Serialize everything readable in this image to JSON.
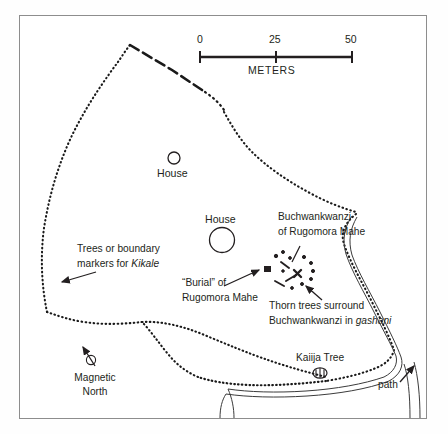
{
  "map": {
    "title": "Archaeological site plan of Rugomora Mahe",
    "frame": {
      "border_color": "#8d8d8d"
    },
    "scale_bar": {
      "ticks": [
        "0",
        "25",
        "50"
      ],
      "unit_label": "METERS",
      "max_meters": 50
    },
    "compass": {
      "label_line1": "Magnetic",
      "label_line2": "North"
    },
    "labels": {
      "house_upper": "House",
      "house_lower": "House",
      "buchwankwanzi_line1": "Buchwankwanzi",
      "buchwankwanzi_line2": "of Rugomora Mahe",
      "trees_line1": "Trees or boundary",
      "trees_line2_pre": "markers for ",
      "trees_line2_em": "Kikale",
      "burial_line1": "“Burial” of",
      "burial_line2": "Rugomora Mahe",
      "thorn_line1": "Thorn trees surround",
      "thorn_line2_pre": "Buchwankwanzi in ",
      "thorn_line2_em": "gashani",
      "kaiija_tree": "Kaiija Tree",
      "path": "path"
    },
    "symbols": {
      "house_circle_small": "house-circle-symbol",
      "house_circle_large": "house-circle-symbol",
      "tree_symbol": "kaiija-tree-symbol",
      "burial_marker": "burial-marker-symbol",
      "thorn_cluster": "thorn-tree-cluster-symbol",
      "compass_needle": "magnetic-north-arrow"
    },
    "colors": {
      "ink": "#231f20",
      "border": "#8d8d8d",
      "boundary": "#1a1a1a"
    }
  }
}
